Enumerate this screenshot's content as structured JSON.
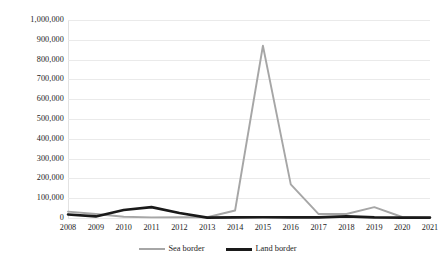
{
  "chart_data": {
    "type": "line",
    "title": "",
    "subtitle": "",
    "xlabel": "",
    "ylabel": "",
    "categories": [
      "2008",
      "2009",
      "2010",
      "2011",
      "2012",
      "2013",
      "2014",
      "2015",
      "2016",
      "2017",
      "2018",
      "2019",
      "2020",
      "2021"
    ],
    "series": [
      {
        "name": "Sea border",
        "color": "#a6a6a6",
        "values": [
          32000,
          20000,
          6000,
          3000,
          4000,
          4000,
          38000,
          870000,
          170000,
          20000,
          20000,
          55000,
          5000,
          2000
        ]
      },
      {
        "name": "Land border",
        "color": "#1a1a1a",
        "values": [
          18000,
          8000,
          40000,
          55000,
          25000,
          2000,
          3000,
          4000,
          3000,
          3000,
          8000,
          3000,
          2000,
          2000
        ]
      }
    ],
    "ylim": [
      0,
      1000000
    ],
    "ytick_values": [
      0,
      100000,
      200000,
      300000,
      400000,
      500000,
      600000,
      700000,
      800000,
      900000,
      1000000
    ],
    "ytick_labels": [
      "0",
      "100,000",
      "200,000",
      "300,000",
      "400,000",
      "500,000",
      "600,000",
      "700,000",
      "800,000",
      "900,000",
      "1,000,000"
    ],
    "grid": true,
    "grid_color": "#eaeaea",
    "legend": true,
    "legend_position": "bottom",
    "background_color": "#ffffff"
  },
  "legend": {
    "items": [
      {
        "label": "Sea border"
      },
      {
        "label": "Land border"
      }
    ]
  }
}
